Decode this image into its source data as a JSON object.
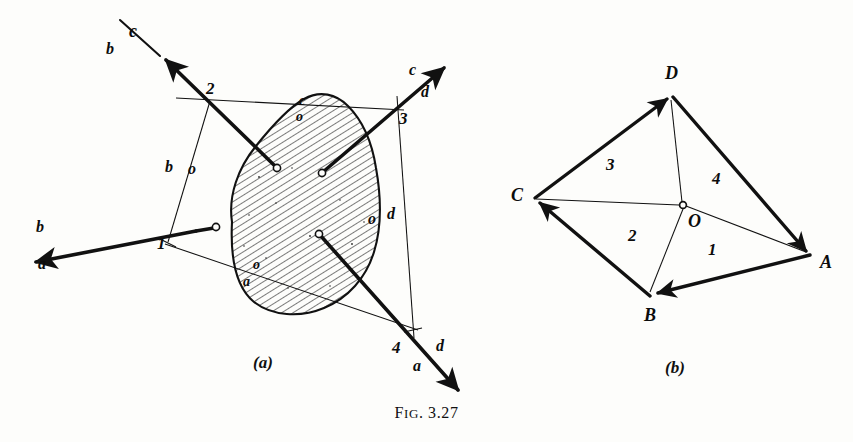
{
  "figure": {
    "caption_prefix": "F",
    "caption_smallcaps": "IG",
    "caption_number": ". 3.27",
    "caption_full": "FIG. 3.27",
    "panel_a_label": "(a)",
    "panel_b_label": "(b)"
  },
  "panel_a": {
    "title": "space diagram with funicular polygon",
    "force_labels": [
      {
        "id": "ba-upper",
        "text": "b"
      },
      {
        "id": "ba-lower",
        "text": "a"
      },
      {
        "id": "bc-upper",
        "text": "c"
      },
      {
        "id": "bc-lower",
        "text": "b"
      },
      {
        "id": "cd-upper",
        "text": "c"
      },
      {
        "id": "cd-lower",
        "text": "d"
      },
      {
        "id": "da-upper",
        "text": "d"
      },
      {
        "id": "da-lower",
        "text": "a"
      }
    ],
    "space_labels": [
      {
        "id": "ray-b",
        "text": "b"
      },
      {
        "id": "ray-o-left",
        "text": "o"
      },
      {
        "id": "blob-c",
        "text": "c"
      },
      {
        "id": "blob-o-top",
        "text": "o"
      },
      {
        "id": "ray-o-right",
        "text": "o"
      },
      {
        "id": "ray-d",
        "text": "d"
      },
      {
        "id": "blob-o-bottom",
        "text": "o"
      },
      {
        "id": "blob-a",
        "text": "a"
      }
    ],
    "string_points": [
      {
        "id": "point-1",
        "text": "1"
      },
      {
        "id": "point-2",
        "text": "2"
      },
      {
        "id": "point-3",
        "text": "3"
      },
      {
        "id": "point-4",
        "text": "4"
      }
    ]
  },
  "panel_b": {
    "title": "force polygon with pole O",
    "vertices": [
      {
        "id": "vertex-a",
        "text": "A"
      },
      {
        "id": "vertex-b",
        "text": "B"
      },
      {
        "id": "vertex-c",
        "text": "C"
      },
      {
        "id": "vertex-d",
        "text": "D"
      },
      {
        "id": "pole-o",
        "text": "O"
      }
    ],
    "ray_numbers": [
      {
        "id": "ray-1",
        "text": "1"
      },
      {
        "id": "ray-2",
        "text": "2"
      },
      {
        "id": "ray-3",
        "text": "3"
      },
      {
        "id": "ray-4",
        "text": "4"
      }
    ]
  },
  "style": {
    "ink": "#111111",
    "paper": "#fdfdfb",
    "hatch": "#1a1a1a"
  }
}
